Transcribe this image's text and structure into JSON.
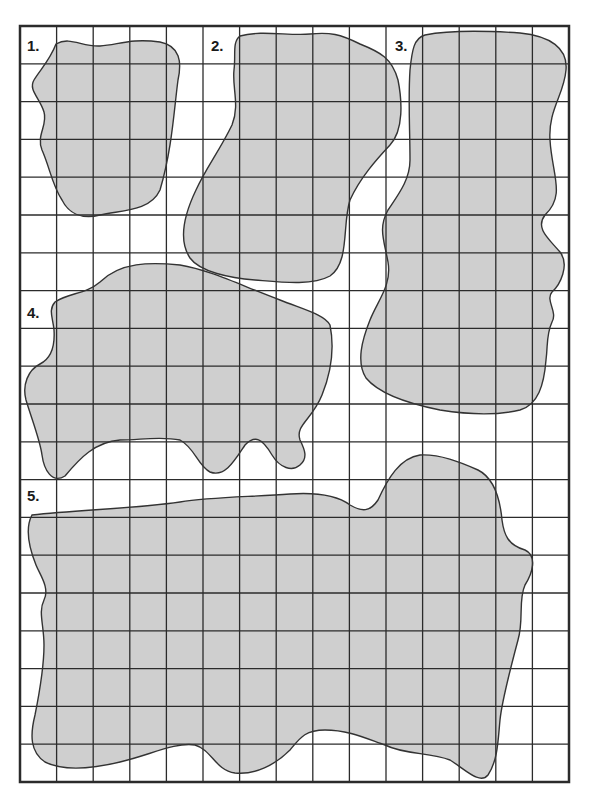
{
  "worksheet": {
    "grid": {
      "left": 20,
      "top": 26,
      "right": 569,
      "bottom": 782,
      "cols": 15,
      "rows": 20
    },
    "colors": {
      "fill": "#cfcfcf",
      "stroke": "#333333",
      "grid": "#2b2b2b",
      "background": "#ffffff"
    },
    "shapes": [
      {
        "label": "1.",
        "lx": 27,
        "ly": 51,
        "d": "M56,44 C70,36 82,47 100,46 C118,45 130,38 160,42 C180,46 182,62 178,80 C174,110 172,150 160,190 C150,212 120,210 100,215 C80,220 68,212 62,200 C52,185 50,168 42,150 C36,135 48,125 44,112 C40,98 28,90 34,80 C40,70 50,60 56,44 Z"
      },
      {
        "label": "2.",
        "lx": 211,
        "ly": 51,
        "d": "M240,36 C260,30 290,36 310,34 C330,32 340,34 360,44 C380,52 392,58 398,80 C402,100 404,130 390,145 C376,160 360,178 350,200 C342,225 350,262 330,276 C312,286 280,282 255,280 C230,278 200,272 190,258 C178,240 184,215 196,190 C206,168 220,150 232,125 C240,105 232,88 234,70 C236,55 232,42 240,36 Z"
      },
      {
        "label": "3.",
        "lx": 395,
        "ly": 51,
        "d": "M425,35 C450,30 490,31 520,33 C550,36 568,48 566,70 C564,95 548,110 550,140 C552,175 566,195 545,215 C535,228 548,238 560,252 C570,265 560,285 552,292 C545,300 558,312 552,322 C546,335 548,345 546,360 C544,385 538,405 520,410 C495,416 465,414 440,410 C410,404 380,395 366,378 C356,362 362,340 370,320 C378,300 392,285 388,262 C384,240 378,228 388,210 C398,195 410,180 410,160 C410,130 408,100 410,70 C412,50 414,38 425,35 Z"
      },
      {
        "label": "4.",
        "lx": 27,
        "ly": 318,
        "d": "M55,302 C70,292 85,295 100,282 C120,262 150,262 180,265 C210,270 240,285 280,300 C305,310 325,315 330,325 C334,345 332,370 322,395 C312,420 295,425 300,440 C305,450 308,458 300,465 C292,472 280,468 272,455 C262,438 255,435 245,445 C235,460 225,478 210,472 C198,466 195,448 180,440 C160,436 140,440 120,440 C95,442 80,458 65,476 C52,484 44,470 42,455 C40,440 32,420 26,400 C22,385 28,370 40,364 C52,358 55,345 54,330 C53,318 48,310 55,302 Z"
      },
      {
        "label": "5.",
        "lx": 27,
        "ly": 501,
        "d": "M32,515 C80,510 140,508 180,502 C210,497 250,497 290,494 C320,492 338,496 350,505 C362,512 370,512 378,500 C388,478 400,458 420,455 C440,454 460,462 478,470 C494,478 500,498 502,520 C504,535 508,545 525,550 C538,556 532,574 525,585 C518,600 524,620 518,640 C510,670 502,700 500,720 C498,740 498,760 488,775 C480,785 466,770 450,760 C430,752 405,755 385,745 C365,738 348,730 325,730 C305,730 300,738 290,750 C275,765 255,775 235,773 C215,770 212,750 195,745 C175,742 150,755 120,762 C95,768 65,772 45,762 C30,752 30,735 35,715 C40,690 44,665 44,645 C44,625 38,612 44,600 C50,588 40,575 36,565 C30,550 24,530 32,515 Z"
      }
    ]
  }
}
